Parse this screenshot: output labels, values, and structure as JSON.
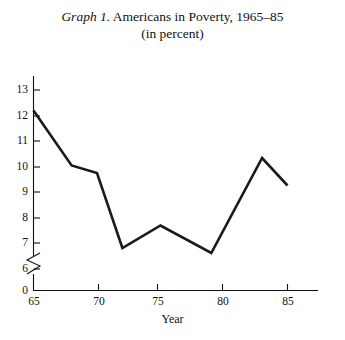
{
  "title": {
    "graph_label": "Graph 1.",
    "main": " Americans in Poverty, 1965–85",
    "subtitle": "(in percent)"
  },
  "axes": {
    "x_title": "Year",
    "y_title": "",
    "y_ticks": [
      "0",
      "6",
      "7",
      "8",
      "9",
      "10",
      "11",
      "12",
      "13"
    ],
    "x_ticks": [
      "65",
      "70",
      "75",
      "80",
      "85"
    ],
    "y_axis_break": true
  },
  "colors": {
    "line": "#1a1a1a",
    "axis": "#111111",
    "background": "#ffffff"
  },
  "chart_data": {
    "type": "line",
    "title": "Graph 1. Americans in Poverty, 1965–85 (in percent)",
    "xlabel": "Year",
    "ylabel": "",
    "xlim": [
      65,
      87
    ],
    "ylim": [
      6,
      13.5
    ],
    "y_axis_break": {
      "from": 0,
      "to": 6
    },
    "grid": false,
    "legend": "none",
    "x_tick_values": [
      65,
      70,
      75,
      80,
      85
    ],
    "y_tick_values": [
      0,
      6,
      7,
      8,
      9,
      10,
      11,
      12,
      13
    ],
    "series": [
      {
        "name": "Americans in Poverty (percent)",
        "x": [
          1965,
          1968,
          1970,
          1972,
          1975,
          1979,
          1983,
          1985
        ],
        "values": [
          12.3,
          10.1,
          9.8,
          6.8,
          7.7,
          6.6,
          10.4,
          9.3
        ]
      }
    ]
  }
}
